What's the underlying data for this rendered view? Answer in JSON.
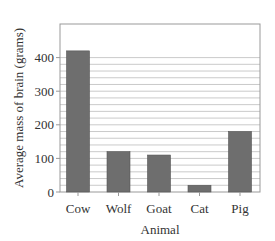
{
  "chart_data": {
    "type": "bar",
    "title": "",
    "xlabel": "Animal",
    "ylabel": "Average mass of brain (grams)",
    "categories": [
      "Cow",
      "Wolf",
      "Goat",
      "Cat",
      "Pig"
    ],
    "values": [
      420,
      120,
      110,
      20,
      180
    ],
    "ylim": [
      0,
      500
    ],
    "yticks": [
      0,
      100,
      200,
      300,
      400
    ],
    "minor_grid_step": 20,
    "grid_max": 400,
    "grid": true,
    "legend": null,
    "colors": {
      "bar": "#6e6e6e",
      "bar_edge": "#555555",
      "grid": "#bdbdbd",
      "frame": "#999999",
      "text": "#333333"
    }
  }
}
